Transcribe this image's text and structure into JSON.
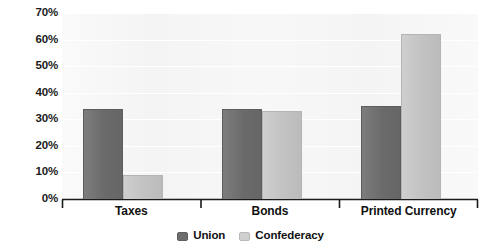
{
  "chart_data": {
    "type": "bar",
    "title": "",
    "subtitle": "",
    "xlabel": "",
    "ylabel": "",
    "categories": [
      "Taxes",
      "Bonds",
      "Printed Currency"
    ],
    "series": [
      {
        "name": "Union",
        "color": "#6e6e6e",
        "values": [
          34,
          34,
          35
        ]
      },
      {
        "name": "Confederacy",
        "color": "#c9c9c9",
        "values": [
          9,
          33,
          62
        ]
      }
    ],
    "ylim": [
      0,
      70
    ],
    "ytick_values": [
      70,
      60,
      50,
      40,
      30,
      20,
      10,
      0
    ],
    "ytick_labels": [
      "70%",
      "60%",
      "50%",
      "40%",
      "30%",
      "20%",
      "10%",
      "0%"
    ],
    "grid": true,
    "grid_axis": "y",
    "legend_position": "bottom",
    "value_unit": "%",
    "annotations": []
  },
  "style": {
    "plot_background": "#f4f4f4",
    "page_background": "#ffffff",
    "axis_color": "#1a1a1a",
    "gridline_color": "#ffffff",
    "label_color": "#111111"
  }
}
